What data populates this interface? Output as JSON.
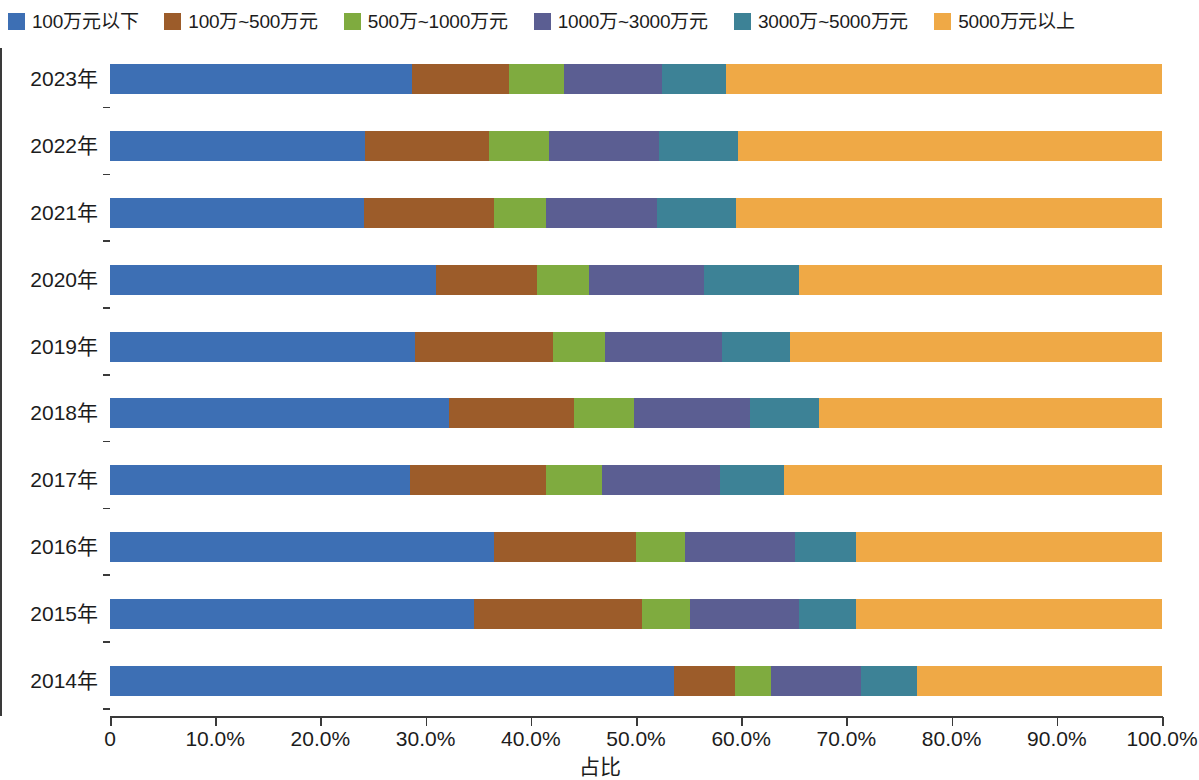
{
  "chart_data": {
    "type": "bar",
    "orientation": "horizontal",
    "stacked": true,
    "stack_mode": "percent",
    "title": "",
    "xlabel": "占比",
    "ylabel": "",
    "xlim": [
      0,
      100
    ],
    "grid": false,
    "legend_position": "top",
    "x_tick_labels": [
      "0",
      "10.0%",
      "20.0%",
      "30.0%",
      "40.0%",
      "50.0%",
      "60.0%",
      "70.0%",
      "80.0%",
      "90.0%",
      "100.0%"
    ],
    "x_tick_values": [
      0,
      10,
      20,
      30,
      40,
      50,
      60,
      70,
      80,
      90,
      100
    ],
    "categories": [
      "2023年",
      "2022年",
      "2021年",
      "2020年",
      "2019年",
      "2018年",
      "2017年",
      "2016年",
      "2015年",
      "2014年"
    ],
    "series": [
      {
        "name": "100万元以下",
        "color": "#3d6fb4",
        "values": [
          28.7,
          24.2,
          24.1,
          31.0,
          29.0,
          32.2,
          28.5,
          36.5,
          34.6,
          53.6
        ]
      },
      {
        "name": "100万~500万元",
        "color": "#9c5c2a",
        "values": [
          9.2,
          11.8,
          12.4,
          9.6,
          13.1,
          11.9,
          12.9,
          13.5,
          16.0,
          5.8
        ]
      },
      {
        "name": "500万~1000万元",
        "color": "#7fab3f",
        "values": [
          5.3,
          5.7,
          4.9,
          4.9,
          5.0,
          5.7,
          5.4,
          4.7,
          4.5,
          3.4
        ]
      },
      {
        "name": "1000万~3000万元",
        "color": "#5b5e92",
        "values": [
          9.3,
          10.5,
          10.6,
          11.0,
          11.1,
          11.0,
          11.2,
          10.4,
          10.4,
          8.6
        ]
      },
      {
        "name": "3000万~5000万元",
        "color": "#3d8296",
        "values": [
          6.1,
          7.5,
          7.5,
          9.0,
          6.4,
          6.6,
          6.1,
          5.8,
          5.4,
          5.3
        ]
      },
      {
        "name": "5000万元以上",
        "color": "#efa946",
        "values": [
          41.4,
          40.3,
          40.5,
          34.5,
          35.4,
          32.6,
          35.9,
          29.1,
          29.1,
          23.3
        ]
      }
    ]
  }
}
